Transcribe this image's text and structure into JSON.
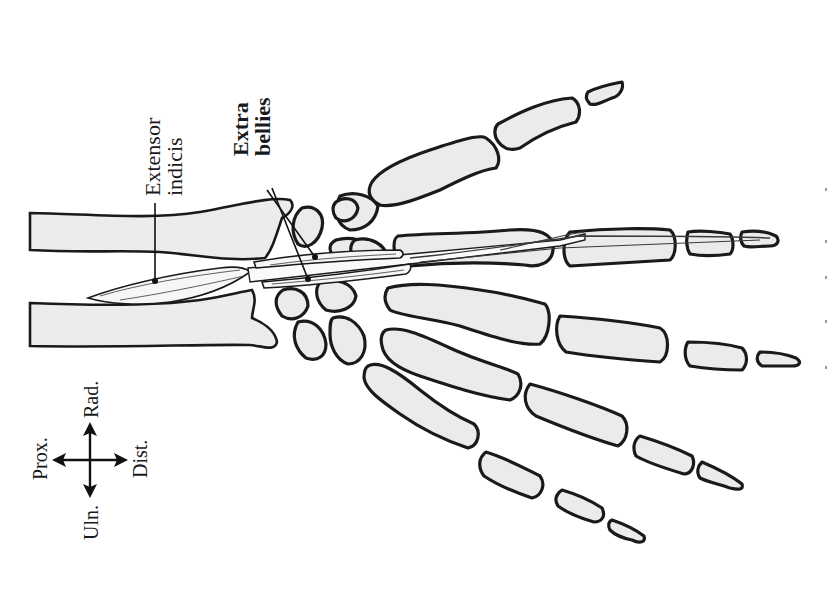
{
  "figure": {
    "background_color": "#ffffff",
    "bone_fill_color": "#ebebeb",
    "outline_color": "#1a1a1a"
  },
  "labels": {
    "extensor_indicis": {
      "line1": "Extensor",
      "line2": "indicis"
    },
    "extra_bellies": {
      "line1": "Extra",
      "line2": "bellies"
    }
  },
  "orientation": {
    "prox": "Prox.",
    "dist": "Dist.",
    "rad": "Rad.",
    "uln": "Uln."
  }
}
